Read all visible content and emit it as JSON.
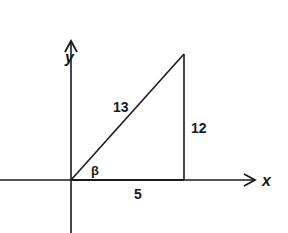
{
  "diagram": {
    "type": "right-triangle-on-axes",
    "axes": {
      "x_label": "x",
      "y_label": "y"
    },
    "triangle": {
      "hypotenuse": "13",
      "opposite": "12",
      "adjacent": "5",
      "angle": "β"
    },
    "colors": {
      "ink": "#1a1a1a",
      "background": "#ffffff"
    }
  }
}
